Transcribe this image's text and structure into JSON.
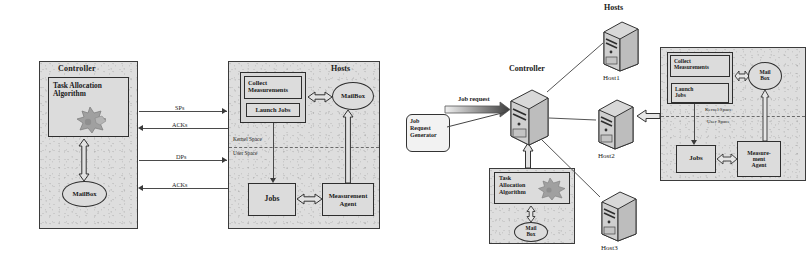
{
  "figure": {
    "left_diagram": {
      "controller": {
        "title": "Controller",
        "task_box": {
          "line1": "Task Allocation",
          "line2": "Algorithm"
        },
        "mailbox": "MailBox"
      },
      "hosts": {
        "title": "Hosts",
        "collect": {
          "line1": "Collect",
          "line2": "Measurements"
        },
        "launch": "Launch Jobs",
        "mailbox": "MailBox",
        "kernel_space": "Kernel Space",
        "user_space": "User Space",
        "jobs": "Jobs",
        "agent": {
          "line1": "Measurement",
          "line2": "Agent"
        }
      },
      "links": [
        {
          "label": "SPs",
          "direction": "right"
        },
        {
          "label": "ACKs",
          "direction": "left"
        },
        {
          "label": "DPs",
          "direction": "right"
        },
        {
          "label": "ACKs",
          "direction": "left"
        }
      ]
    },
    "right_diagram": {
      "hosts_title": "Hosts",
      "controller_title": "Controller",
      "job_request_label": "Job request",
      "job_request_generator": {
        "line1": "Job",
        "line2": "Request",
        "line3": "Generator"
      },
      "host_labels": [
        "Host1",
        "Host2",
        "Host3"
      ],
      "task_panel": {
        "task_box": {
          "line1": "Task",
          "line2": "Allocation",
          "line3": "Algorithm"
        },
        "mailbox": {
          "line1": "Mail",
          "line2": "Box"
        }
      },
      "detail_panel": {
        "collect": {
          "line1": "Collect",
          "line2": "Measurements"
        },
        "launch": {
          "line1": "Launch",
          "line2": "Jobs"
        },
        "mailbox": {
          "line1": "Mail",
          "line2": "Box"
        },
        "kernel_space": "Kernel Space",
        "user_space": "User Space",
        "jobs": "Jobs",
        "agent": {
          "line1": "Measure-",
          "line2": "ment",
          "line3": "Agent"
        }
      }
    },
    "colors": {
      "panel_fill": "#dedede",
      "box_fill": "#dcdcdc",
      "stroke": "#2e2e2e",
      "line": "#4a4a4a",
      "text": "#1a1a1a",
      "star_fill": "#9a9a9a"
    }
  }
}
